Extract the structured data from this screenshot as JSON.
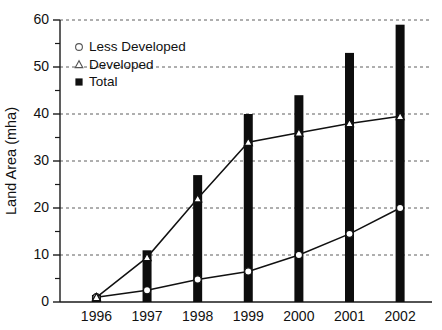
{
  "chart_data": {
    "type": "bar",
    "title": "",
    "subtitle": "",
    "xlabel": "",
    "ylabel": "Land Area (mha)",
    "categories": [
      "1996",
      "1997",
      "1998",
      "1999",
      "2000",
      "2001",
      "2002"
    ],
    "xlim": [
      1995.5,
      2002.5
    ],
    "ylim": [
      0,
      60
    ],
    "y_ticks_major": [
      0,
      10,
      20,
      30,
      40,
      50,
      60
    ],
    "y_ticks_minor": [
      5,
      15,
      25,
      35,
      45,
      55
    ],
    "grid": "horizontal-dashed",
    "legend_position": "upper-left-inside",
    "series": [
      {
        "name": "Less Developed",
        "marker": "open-circle",
        "render": "line",
        "values": [
          1.0,
          2.5,
          4.8,
          6.5,
          10.0,
          14.5,
          20.0
        ]
      },
      {
        "name": "Developed",
        "marker": "open-triangle",
        "render": "line",
        "values": [
          1.0,
          9.5,
          22.0,
          34.0,
          36.0,
          38.0,
          39.5
        ]
      },
      {
        "name": "Total",
        "marker": "filled-square",
        "render": "bar",
        "values": [
          1.5,
          11.0,
          27.0,
          40.0,
          44.0,
          53.0,
          59.0
        ]
      }
    ],
    "colors": {
      "bar": "#0d0d0d",
      "line": "#111111",
      "marker_fill": "#ffffff",
      "grid": "#4d4d4d",
      "axis": "#1a1a1a",
      "background": "#ffffff"
    }
  }
}
